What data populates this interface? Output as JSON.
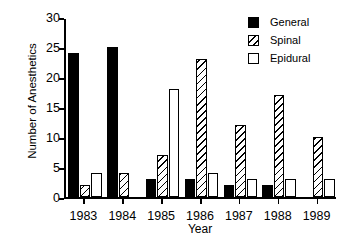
{
  "chart_data": {
    "type": "bar",
    "title": "",
    "xlabel": "Year",
    "ylabel": "Number of Anesthetics",
    "categories": [
      "1983",
      "1984",
      "1985",
      "1986",
      "1987",
      "1988",
      "1989"
    ],
    "series": [
      {
        "name": "General",
        "values": [
          24,
          25,
          3,
          3,
          2,
          2,
          0
        ]
      },
      {
        "name": "Spinal",
        "values": [
          2,
          4,
          7,
          23,
          12,
          17,
          10
        ]
      },
      {
        "name": "Epidural",
        "values": [
          4,
          0,
          18,
          4,
          3,
          3,
          3
        ]
      }
    ],
    "ylim": [
      0,
      30
    ],
    "yticks": [
      0,
      5,
      10,
      15,
      20,
      25,
      30
    ],
    "ytick_labels": [
      "0",
      "5",
      "10",
      "15",
      "20",
      "25",
      "30"
    ],
    "grid": false,
    "legend_position": "top-right"
  },
  "legend": {
    "items": [
      {
        "label": "General",
        "swatch": "solid-black-swatch"
      },
      {
        "label": "Spinal",
        "swatch": "diagonal-hatch-swatch"
      },
      {
        "label": "Epidural",
        "swatch": "empty-white-swatch"
      }
    ]
  }
}
